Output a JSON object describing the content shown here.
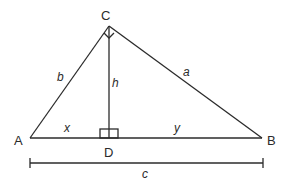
{
  "figure": {
    "type": "right-triangle-with-altitude",
    "vertices": {
      "A": "A",
      "B": "B",
      "C": "C",
      "D": "D"
    },
    "side_labels": {
      "a": "a",
      "b": "b",
      "c": "c",
      "h": "h",
      "x": "x",
      "y": "y"
    },
    "right_angles": [
      "C",
      "D"
    ],
    "stroke_color": "#2b2b2b",
    "background": "#ffffff"
  }
}
